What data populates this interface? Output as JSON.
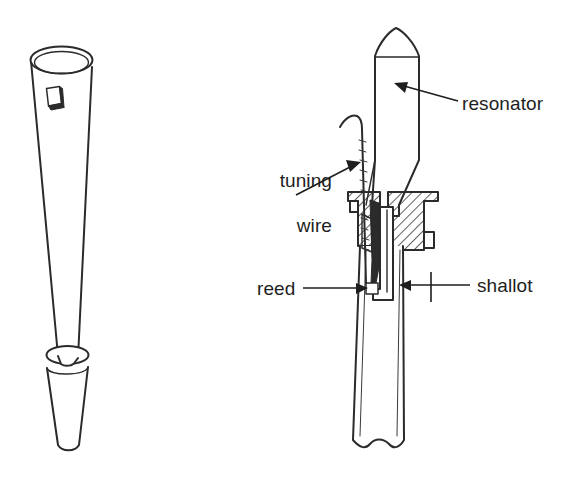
{
  "figure": {
    "background_color": "#ffffff",
    "ink_color": "#2b2b2b",
    "text_color": "#1e1e1e",
    "width": 577,
    "height": 487
  },
  "views": {
    "left": {
      "name": "exterior-perspective-view",
      "description": "conical reed pipe resonator in perspective with tuning slot and boot"
    },
    "right": {
      "name": "cross-section-view",
      "description": "sectioned reed pipe showing resonator, tuning wire, block, reed and shallot"
    }
  },
  "labels": [
    {
      "id": "tuning-wire",
      "line1": "tuning",
      "line2": "wire",
      "text": "tuning wire"
    },
    {
      "id": "reed",
      "text": "reed"
    },
    {
      "id": "resonator",
      "text": "resonator"
    },
    {
      "id": "shallot",
      "text": "shallot"
    }
  ]
}
